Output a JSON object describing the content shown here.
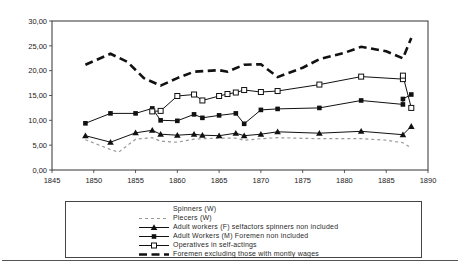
{
  "chart_data": {
    "type": "line",
    "title": "",
    "xlabel": "",
    "ylabel": "",
    "xlim": [
      1845,
      1890
    ],
    "ylim": [
      0,
      30
    ],
    "x_ticks": [
      1845,
      1850,
      1855,
      1860,
      1865,
      1870,
      1875,
      1880,
      1885,
      1890
    ],
    "y_ticks": [
      0,
      5,
      10,
      15,
      20,
      25,
      30
    ],
    "y_tick_labels": [
      "0,00",
      "5,00",
      "10,00",
      "15,00",
      "20,00",
      "25,00",
      "30,00"
    ],
    "grid": false,
    "legend_position": "bottom-box",
    "series": [
      {
        "name": "Spinners (W)",
        "line": "none",
        "marker": "none",
        "color": "#bbbbbb",
        "width": 1,
        "dash": "",
        "x": [],
        "values": []
      },
      {
        "name": "Piecers (W)",
        "line": "dashed",
        "marker": "none",
        "color": "#999999",
        "width": 1.2,
        "dash": "3,3",
        "x": [
          1849,
          1852,
          1853,
          1855,
          1857,
          1858,
          1860,
          1862,
          1863,
          1865,
          1867,
          1868,
          1870,
          1872,
          1877,
          1882,
          1885,
          1887,
          1888
        ],
        "values": [
          6.1,
          4.1,
          3.6,
          6.2,
          6.5,
          5.8,
          5.6,
          6.2,
          6.3,
          6.4,
          6.4,
          6.0,
          6.3,
          6.5,
          6.3,
          6.3,
          6.0,
          5.5,
          4.4
        ]
      },
      {
        "name": "Adult workers (F) selfactors spinners non included",
        "line": "solid",
        "marker": "triangle",
        "color": "#111111",
        "width": 1,
        "dash": "",
        "x": [
          1849,
          1852,
          1855,
          1857,
          1858,
          1860,
          1862,
          1863,
          1865,
          1867,
          1868,
          1870,
          1872,
          1877,
          1882,
          1887,
          1888
        ],
        "values": [
          6.9,
          5.6,
          7.5,
          8.0,
          7.2,
          7.0,
          7.2,
          7.0,
          6.9,
          7.4,
          6.9,
          7.2,
          7.7,
          7.4,
          7.8,
          7.1,
          8.8
        ]
      },
      {
        "name": "Adult Workers (M) Foremen non included",
        "line": "solid",
        "marker": "square",
        "color": "#111111",
        "width": 1,
        "dash": "",
        "x": [
          1849,
          1852,
          1855,
          1857,
          1858,
          1860,
          1862,
          1863,
          1865,
          1867,
          1868,
          1870,
          1872,
          1877,
          1882,
          1887,
          1887,
          1888
        ],
        "values": [
          9.4,
          11.4,
          11.4,
          12.4,
          10.0,
          9.9,
          11.2,
          10.5,
          11.0,
          11.4,
          9.3,
          12.1,
          12.3,
          12.5,
          14.0,
          13.2,
          14.3,
          15.2
        ]
      },
      {
        "name": "Operatives in self-actings",
        "line": "solid",
        "marker": "open-square",
        "color": "#111111",
        "width": 1,
        "dash": "",
        "x": [
          1857,
          1858,
          1860,
          1862,
          1863,
          1865,
          1866,
          1867,
          1868,
          1870,
          1872,
          1877,
          1882,
          1887,
          1887,
          1888
        ],
        "values": [
          11.8,
          11.9,
          14.9,
          15.2,
          14.0,
          14.9,
          15.3,
          15.6,
          16.1,
          15.7,
          15.9,
          17.2,
          18.8,
          18.3,
          19.0,
          12.5
        ]
      },
      {
        "name": "Foremen excluding those with montly wages",
        "line": "dashed",
        "marker": "none",
        "color": "#111111",
        "width": 2.6,
        "dash": "8,4.5",
        "x": [
          1849,
          1852,
          1854,
          1856,
          1858,
          1860,
          1862,
          1865,
          1866,
          1868,
          1870,
          1872,
          1875,
          1877,
          1880,
          1882,
          1885,
          1887,
          1888
        ],
        "values": [
          21.2,
          23.4,
          21.8,
          18.5,
          17.0,
          18.5,
          19.8,
          20.1,
          19.8,
          21.2,
          21.3,
          18.7,
          20.6,
          22.3,
          23.6,
          24.8,
          23.9,
          22.5,
          26.6
        ]
      }
    ]
  }
}
